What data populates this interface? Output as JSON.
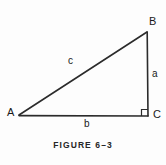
{
  "figure": {
    "caption": "FIGURE 6–3",
    "type": "right-triangle-diagram",
    "stroke_color": "#2b2b2b",
    "background_color": "#fdfdfd",
    "vertices": [
      {
        "name": "A",
        "label": "A",
        "x": 19,
        "y": 115
      },
      {
        "name": "B",
        "label": "B",
        "x": 147,
        "y": 32
      },
      {
        "name": "C",
        "label": "C",
        "x": 148,
        "y": 116
      }
    ],
    "sides": [
      {
        "name": "hypotenuse",
        "label": "c",
        "from": "A",
        "to": "B"
      },
      {
        "name": "opposite",
        "label": "a",
        "from": "B",
        "to": "C"
      },
      {
        "name": "adjacent",
        "label": "b",
        "from": "A",
        "to": "C"
      }
    ],
    "right_angle": {
      "at": "C",
      "marker": "square",
      "size": 6
    }
  }
}
